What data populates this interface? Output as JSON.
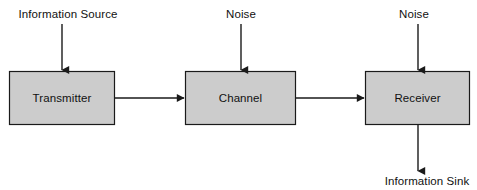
{
  "diagram": {
    "canvas": {
      "width": 477,
      "height": 190,
      "background": "#ffffff"
    },
    "style": {
      "box_fill": "#cccccc",
      "box_stroke": "#1a1a1a",
      "arrow_color": "#1a1a1a",
      "text_color": "#111111"
    },
    "blocks": [
      {
        "id": "transmitter",
        "label": "Transmitter",
        "x": 9,
        "y": 71,
        "width": 106,
        "height": 54,
        "center_x": 62,
        "center_y": 98
      },
      {
        "id": "channel",
        "label": "Channel",
        "x": 185,
        "y": 71,
        "width": 111,
        "height": 54,
        "center_x": 240.5,
        "center_y": 98
      },
      {
        "id": "receiver",
        "label": "Receiver",
        "x": 365,
        "y": 71,
        "width": 105,
        "height": 54,
        "center_x": 417.5,
        "center_y": 98
      }
    ],
    "labels": [
      {
        "id": "information-source",
        "text": "Information Source",
        "center_x": 68,
        "center_y": 14
      },
      {
        "id": "noise-channel",
        "text": "Noise",
        "center_x": 241,
        "center_y": 14
      },
      {
        "id": "noise-receiver",
        "text": "Noise",
        "center_x": 414,
        "center_y": 14
      },
      {
        "id": "information-sink",
        "text": "Information Sink",
        "center_x": 427,
        "center_y": 181
      }
    ],
    "arrows": [
      {
        "id": "source-to-transmitter",
        "from": "information-source",
        "to": "transmitter",
        "direction": "down",
        "x1": 62,
        "y1": 24,
        "x2": 62,
        "y2": 70
      },
      {
        "id": "transmitter-to-channel",
        "from": "transmitter",
        "to": "channel",
        "direction": "right",
        "x1": 115,
        "y1": 98,
        "x2": 184,
        "y2": 98
      },
      {
        "id": "noise-to-channel",
        "from": "noise-channel",
        "to": "channel",
        "direction": "down",
        "x1": 241,
        "y1": 24,
        "x2": 241,
        "y2": 70
      },
      {
        "id": "channel-to-receiver",
        "from": "channel",
        "to": "receiver",
        "direction": "right",
        "x1": 296,
        "y1": 98,
        "x2": 364,
        "y2": 98
      },
      {
        "id": "noise-to-receiver",
        "from": "noise-receiver",
        "to": "receiver",
        "direction": "down",
        "x1": 418,
        "y1": 24,
        "x2": 418,
        "y2": 70
      },
      {
        "id": "receiver-to-sink",
        "from": "receiver",
        "to": "information-sink",
        "direction": "down",
        "x1": 418,
        "y1": 125,
        "x2": 418,
        "y2": 171
      }
    ]
  }
}
